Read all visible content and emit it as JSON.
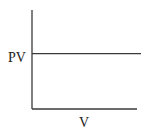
{
  "chart_data": {
    "type": "line",
    "title": "",
    "xlabel": "V",
    "ylabel": "PV",
    "xlim": [
      0,
      1
    ],
    "ylim": [
      0,
      1
    ],
    "grid": false,
    "legend": "none",
    "series": [
      {
        "name": "PV",
        "x": [
          0,
          1
        ],
        "y": [
          0.56,
          0.56
        ]
      }
    ]
  },
  "colors": {
    "line": "#3a3a3a",
    "text": "#222222",
    "background": "#ffffff"
  }
}
